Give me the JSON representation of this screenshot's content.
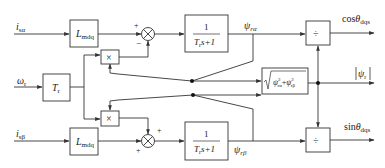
{
  "diagram": {
    "type": "block-diagram",
    "inputs": {
      "i_s_alpha": {
        "var": "i",
        "sub": "sα"
      },
      "omega_r": {
        "var": "ω",
        "sub": "r"
      },
      "i_s_beta": {
        "var": "i",
        "sub": "sβ"
      }
    },
    "blocks": {
      "lmdq_top": {
        "main": "L",
        "sub": "mdq"
      },
      "lmdq_bottom": {
        "main": "L",
        "sub": "mdq"
      },
      "tr_gain": {
        "main": "T",
        "sub": "r"
      },
      "mult_top": {
        "symbol": "×"
      },
      "mult_bottom": {
        "symbol": "×"
      },
      "tf_top": {
        "num": "1",
        "den_a": "T",
        "den_sub": "r",
        "den_b": "s+1"
      },
      "tf_bottom": {
        "num": "1",
        "den_a": "T",
        "den_sub": "r",
        "den_b": "s+1"
      },
      "sqrt": {
        "label": "√(ψ²rα + ψ²rβ)",
        "t1": "ψ",
        "t1_sup": "2",
        "t1_sub": "rα",
        "plus": "+",
        "t2": "ψ",
        "t2_sup": "2",
        "t2_sub": "rβ"
      },
      "div_top": {
        "symbol": "÷"
      },
      "div_bottom": {
        "symbol": "÷"
      }
    },
    "sum_junctions": {
      "top": {
        "signs": [
          "+",
          "−"
        ]
      },
      "bottom": {
        "signs": [
          "+",
          "+"
        ]
      }
    },
    "signals": {
      "psi_r_alpha": {
        "var": "ψ",
        "sub": "rα"
      },
      "psi_r_beta": {
        "var": "ψ",
        "sub": "rβ"
      },
      "psi_r_mag": {
        "label": "|ψr|",
        "var": "ψ",
        "sub": "r"
      }
    },
    "outputs": {
      "cos": {
        "fn": "cos",
        "var": "θ",
        "sub": "dqs"
      },
      "sin": {
        "fn": "sin",
        "var": "θ",
        "sub": "dqs"
      }
    },
    "colors": {
      "line": "#333333",
      "text": "#222222",
      "background": "#ffffff"
    }
  }
}
